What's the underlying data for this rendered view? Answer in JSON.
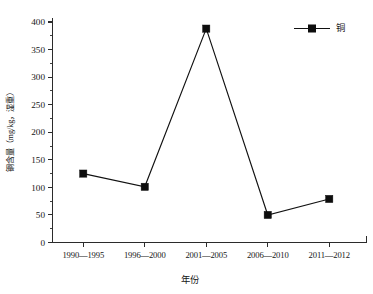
{
  "chart_data": {
    "type": "line",
    "title": "",
    "xlabel": "年份",
    "ylabel": "铜含量（mg/kg，湿重）",
    "categories": [
      "1990—1995",
      "1996—2000",
      "2001—2005",
      "2006—2010",
      "2011—2012"
    ],
    "series": [
      {
        "name": "铜",
        "values": [
          125,
          101,
          388,
          50,
          79
        ]
      }
    ],
    "ylim": [
      0,
      400
    ],
    "ytick_labels": [
      "0",
      "50",
      "100",
      "150",
      "200",
      "250",
      "300",
      "350",
      "400"
    ],
    "ytick_values": [
      0,
      50,
      100,
      150,
      200,
      250,
      300,
      350,
      400
    ],
    "yminor_step": 25,
    "grid": false,
    "legend": {
      "position": "top-right",
      "entries": [
        "铜"
      ]
    },
    "marker_style": "square",
    "line_color": "#111111",
    "marker_color": "#0d0d0d"
  }
}
